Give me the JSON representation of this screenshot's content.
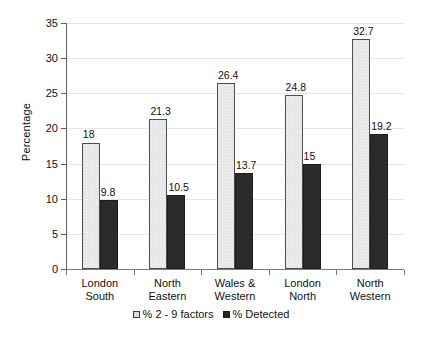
{
  "chart_data": {
    "type": "bar",
    "title": "",
    "xlabel": "",
    "ylabel": "Percentage",
    "ylim": [
      0,
      35
    ],
    "yticks": [
      0,
      5,
      10,
      15,
      20,
      25,
      30,
      35
    ],
    "ytick_labels": [
      "0",
      "5",
      "10",
      "15",
      "20",
      "25",
      "30",
      "35"
    ],
    "grid": true,
    "legend_position": "bottom",
    "categories": [
      "London South",
      "North Eastern",
      "Wales & Western",
      "London North",
      "North Western"
    ],
    "category_lines": [
      [
        "London",
        "South"
      ],
      [
        "North",
        "Eastern"
      ],
      [
        "Wales &",
        "Western"
      ],
      [
        "London",
        "North"
      ],
      [
        "North",
        "Western"
      ]
    ],
    "series": [
      {
        "name": "% 2 - 9 factors",
        "color": "#e2e2e2",
        "values": [
          18,
          21.3,
          26.4,
          24.8,
          32.7
        ],
        "value_labels": [
          "18",
          "21.3",
          "26.4",
          "24.8",
          "32.7"
        ]
      },
      {
        "name": "% Detected",
        "color": "#2b2b2b",
        "values": [
          9.8,
          10.5,
          13.7,
          15,
          19.2
        ],
        "value_labels": [
          "9.8",
          "10.5",
          "13.7",
          "15",
          "19.2"
        ]
      }
    ]
  },
  "legend": {
    "entries": [
      {
        "label": "% 2 - 9 factors",
        "swatch": "light"
      },
      {
        "label": "% Detected",
        "swatch": "dark"
      }
    ]
  }
}
